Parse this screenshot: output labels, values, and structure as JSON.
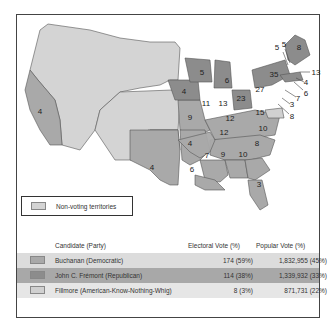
{
  "legend": {
    "territories_label": "Non-voting territories",
    "territories_color": "#d4d4d4"
  },
  "table": {
    "headers": {
      "candidate": "Candidate (Party)",
      "electoral": "Electoral Vote (%)",
      "popular": "Popular Vote (%)"
    },
    "rows": [
      {
        "candidate": "Buchanan (Democratic)",
        "electoral": "174 (59%)",
        "popular": "1,832,955 (45%)",
        "color": "#a9a9a9",
        "row_bg": "#dcdcdc"
      },
      {
        "candidate": "John C. Frémont (Republican)",
        "electoral": "114 (38%)",
        "popular": "1,339,932 (33%)",
        "color": "#8c8c8c",
        "row_bg": "#a8a8a8"
      },
      {
        "candidate": "Fillmore (American-Know-Nothing-Whig)",
        "electoral": "8 (3%)",
        "popular": "871,731 (22%)",
        "color": "#d0d0d0",
        "row_bg": "#e6e6e6"
      }
    ]
  },
  "map": {
    "state_labels": [
      {
        "state": "CA",
        "value": "4"
      },
      {
        "state": "TX",
        "value": "4"
      },
      {
        "state": "IA",
        "value": "4"
      },
      {
        "state": "WI",
        "value": "5"
      },
      {
        "state": "MI",
        "value": "6"
      },
      {
        "state": "IL",
        "value": "11"
      },
      {
        "state": "IN",
        "value": "13"
      },
      {
        "state": "OH",
        "value": "23"
      },
      {
        "state": "PA",
        "value": "27"
      },
      {
        "state": "NY",
        "value": "35"
      },
      {
        "state": "VT",
        "value": "5"
      },
      {
        "state": "NH",
        "value": "5"
      },
      {
        "state": "ME",
        "value": "8"
      },
      {
        "state": "MA",
        "value": "13"
      },
      {
        "state": "RI",
        "value": "4"
      },
      {
        "state": "CT",
        "value": "6"
      },
      {
        "state": "NJ",
        "value": "7"
      },
      {
        "state": "DE",
        "value": "3"
      },
      {
        "state": "MD",
        "value": "8"
      },
      {
        "state": "MO",
        "value": "9"
      },
      {
        "state": "KY",
        "value": "12"
      },
      {
        "state": "VA",
        "value": "15"
      },
      {
        "state": "TN",
        "value": "12"
      },
      {
        "state": "NC",
        "value": "10"
      },
      {
        "state": "AR",
        "value": "4"
      },
      {
        "state": "MS",
        "value": "7"
      },
      {
        "state": "AL",
        "value": "9"
      },
      {
        "state": "GA",
        "value": "10"
      },
      {
        "state": "SC",
        "value": "8"
      },
      {
        "state": "LA",
        "value": "6"
      },
      {
        "state": "FL",
        "value": "3"
      }
    ]
  }
}
